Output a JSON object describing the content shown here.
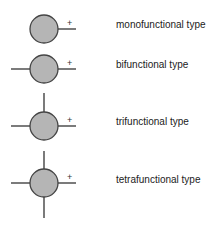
{
  "diagram": {
    "colors": {
      "fill": "#b5b5b5",
      "stroke": "#444444",
      "line": "#333333"
    },
    "charge_symbol": "+",
    "types": [
      {
        "label": "monofunctional type",
        "arms": [
          "right"
        ]
      },
      {
        "label": "bifunctional type",
        "arms": [
          "left",
          "right"
        ]
      },
      {
        "label": "trifunctional type",
        "arms": [
          "left",
          "right",
          "up"
        ]
      },
      {
        "label": "tetrafunctional type",
        "arms": [
          "left",
          "right",
          "up",
          "down"
        ]
      }
    ]
  }
}
